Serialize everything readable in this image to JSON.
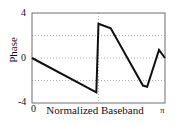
{
  "chart_data": {
    "type": "line",
    "title": "",
    "xlabel": "Normalized Baseband",
    "ylabel": "Phase",
    "xlim": [
      0,
      3.14159
    ],
    "ylim": [
      -4,
      4
    ],
    "grid": true,
    "legend": false,
    "xticks": [
      0,
      3.14159
    ],
    "xticklabels": [
      "0",
      "π"
    ],
    "yticks": [
      -4,
      0,
      4
    ],
    "yticklabels": [
      "-4",
      "0",
      "4"
    ],
    "gridlines_y": [
      -2,
      0,
      2
    ],
    "gridlines_x": [
      1.5708
    ],
    "series": [
      {
        "name": "wrapped phase",
        "x": [
          0.0,
          1.52,
          1.52,
          1.57,
          1.57,
          1.86,
          1.86,
          2.62,
          2.62,
          2.72,
          2.72,
          3.0,
          3.0,
          3.14
        ],
        "values": [
          0.0,
          -3.05,
          -3.05,
          3.05,
          3.05,
          2.65,
          2.65,
          -2.45,
          -2.45,
          -2.55,
          -2.55,
          0.72,
          0.72,
          0.0
        ]
      }
    ]
  },
  "axis": {
    "ytick_top": "4",
    "ytick_mid": "0",
    "ytick_bottom": "-4",
    "xtick_left": "0",
    "xtick_right": "π",
    "xlabel": "Normalized Baseband",
    "ylabel": "Phase"
  },
  "style": {
    "line_color": "#111111",
    "grid_color": "#9a9a9a",
    "frame_color": "#6e6e6e",
    "background": "#ffffff"
  }
}
